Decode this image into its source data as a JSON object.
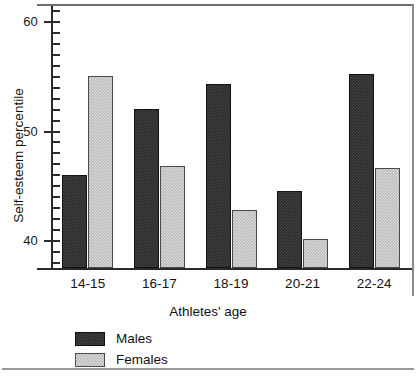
{
  "chart_data": {
    "type": "bar",
    "title": "",
    "xlabel": "Athletes' age",
    "ylabel": "Self-esteem percentile",
    "categories": [
      "14-15",
      "16-17",
      "18-19",
      "20-21",
      "22-24"
    ],
    "series": [
      {
        "name": "Males",
        "color": "#2b2b2b",
        "values": [
          46.0,
          52.1,
          54.4,
          44.6,
          55.3
        ]
      },
      {
        "name": "Females",
        "color": "#b9b9b9",
        "values": [
          55.1,
          46.8,
          42.8,
          40.2,
          46.7
        ]
      }
    ],
    "ylim": [
      37.5,
      61.5
    ],
    "ytick_labels": [
      "60",
      "50",
      "40"
    ],
    "ytick_values": [
      60,
      50,
      40
    ],
    "yminor_step": 1,
    "grid": false,
    "legend_position": "below-axis-left"
  },
  "legend": {
    "items": [
      {
        "label": "Males"
      },
      {
        "label": "Females"
      }
    ]
  }
}
